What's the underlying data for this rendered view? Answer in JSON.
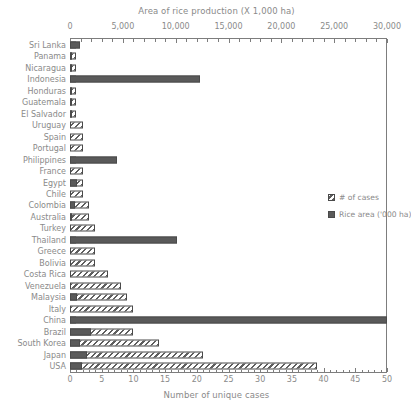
{
  "chart_data": {
    "type": "bar",
    "orientation": "horizontal",
    "title": "",
    "top_axis": {
      "label": "Area of rice production (X 1,000 ha)",
      "ticks": [
        "0",
        "5,000",
        "10,000",
        "15,000",
        "20,000",
        "25,000",
        "30,000"
      ],
      "range": [
        0,
        30000
      ],
      "minor_ticks_per_interval": 5
    },
    "bottom_axis": {
      "label": "Number of unique cases",
      "ticks": [
        "0",
        "5",
        "10",
        "15",
        "20",
        "25",
        "30",
        "35",
        "40",
        "45",
        "50"
      ],
      "range": [
        0,
        50
      ],
      "minor_ticks_per_interval": 5
    },
    "categories": [
      "Sri Lanka",
      "Panama",
      "Nicaragua",
      "Indonesia",
      "Honduras",
      "Guatemala",
      "El Salvador",
      "Uruguay",
      "Spain",
      "Portugal",
      "Philippines",
      "France",
      "Egypt",
      "Chile",
      "Colombia",
      "Australia",
      "Turkey",
      "Thailand",
      "Greece",
      "Bolivia",
      "Costa Rica",
      "Venezuela",
      "Malaysia",
      "Italy",
      "China",
      "Brazil",
      "South Korea",
      "Japan",
      "USA"
    ],
    "series": [
      {
        "name": "# of cases",
        "unit": "cases",
        "axis": "bottom",
        "values": [
          1,
          1,
          1,
          1,
          1,
          1,
          1,
          2,
          2,
          2,
          1,
          2,
          2,
          2,
          3,
          3,
          4,
          1,
          4,
          4,
          6,
          8,
          9,
          10,
          1,
          10,
          14,
          21,
          39
        ]
      },
      {
        "name": "Rice area ('000 ha)",
        "unit": "1000 ha",
        "axis": "top",
        "values": [
          900,
          100,
          100,
          12300,
          100,
          120,
          100,
          0,
          0,
          0,
          4450,
          0,
          650,
          0,
          450,
          80,
          0,
          10100,
          0,
          0,
          0,
          0,
          650,
          0,
          30000,
          2000,
          900,
          1600,
          1100
        ]
      }
    ],
    "legend": {
      "position": "middle-right",
      "entries": [
        {
          "label": "# of cases",
          "swatch": "hatched-diagonal"
        },
        {
          "label": "Rice area ('000 ha)",
          "swatch": "solid-dark-gray"
        }
      ]
    },
    "grid": false,
    "colors": {
      "bar_cases_fill": "#ffffff",
      "bar_cases_hatch": "#5e5e5e",
      "bar_rice_fill": "#5a5a5a",
      "axis": "#7d7d7d",
      "text": "#8a8a8a",
      "background": "#ffffff"
    }
  }
}
